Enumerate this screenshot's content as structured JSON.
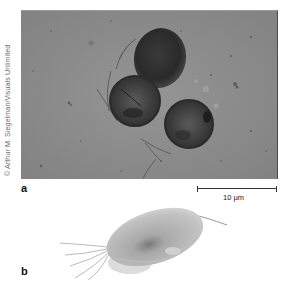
{
  "figure": {
    "credit": "© Arthur M. Siegelman/Visuals Unlimited",
    "panels": [
      {
        "label": "a",
        "type": "light micrograph",
        "subject": "three spherical green algal cells with flagella",
        "scale_bar": {
          "text": "10 µm"
        }
      },
      {
        "label": "b",
        "type": "illustration",
        "subject": "drawing of a single flagellated algal cell"
      }
    ],
    "colors": {
      "micrograph_background": "#8d8d8d",
      "cell_dark": "#2e2e2e",
      "illustration_body": "#b5b5b5",
      "text": "#111111"
    }
  }
}
